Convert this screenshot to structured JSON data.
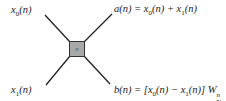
{
  "diagram": {
    "type": "radix-2 DIF butterfly",
    "node_label": "n",
    "inputs": [
      {
        "name": "x",
        "sub": "0",
        "arg": "(n)"
      },
      {
        "name": "x",
        "sub": "1",
        "arg": "(n)"
      }
    ],
    "outputs": {
      "a": {
        "lhs": "a(n) = ",
        "t1": "x",
        "t1_sub": "0",
        "t1_arg": "(n)",
        "op": " + ",
        "t2": "x",
        "t2_sub": "1",
        "t2_arg": "(n)"
      },
      "b": {
        "lhs": "b(n) = [",
        "t1": "x",
        "t1_sub": "0",
        "t1_arg": "(n)",
        "op": " − ",
        "t2": "x",
        "t2_sub": "1",
        "t2_arg": "(n)",
        "close": "] ",
        "w": "W",
        "w_sup": "n",
        "w_sub": "N"
      }
    },
    "colors": {
      "node_fill": "#a8a8a8",
      "line": "#222222"
    }
  }
}
